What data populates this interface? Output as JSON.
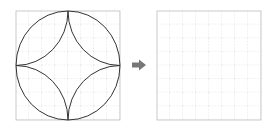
{
  "diagram": {
    "grid": {
      "rows": 8,
      "cols": 8,
      "border_color": "#bdbdbd",
      "line_color": "#c8c8c8"
    },
    "left_panel": {
      "shape": "circle-with-four-inner-arcs",
      "stroke_color": "#333333"
    },
    "arrow": {
      "direction": "right",
      "color": "#777777"
    },
    "right_panel": {
      "shape": "empty-grid"
    }
  }
}
